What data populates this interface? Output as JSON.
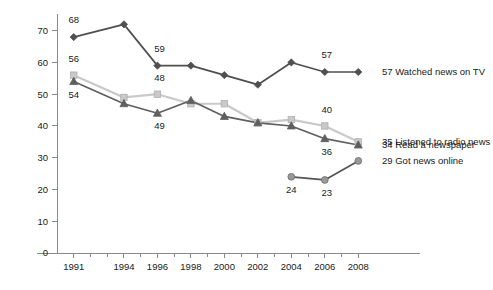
{
  "chart_data": {
    "type": "line",
    "title": "",
    "subtitle": "",
    "xlabel": "",
    "ylabel": "",
    "x": [
      1991,
      1994,
      1996,
      1998,
      2000,
      2002,
      2004,
      2006,
      2008
    ],
    "xtick_labels": [
      "1991",
      "1994",
      "1996",
      "1998",
      "2000",
      "2002",
      "2004",
      "2006",
      "2008"
    ],
    "ytick_labels": [
      "0",
      "10",
      "20",
      "30",
      "40",
      "50",
      "60",
      "70"
    ],
    "ytick_values": [
      0,
      10,
      20,
      30,
      40,
      50,
      60,
      70
    ],
    "xlim": [
      1990,
      2009
    ],
    "ylim": [
      0,
      74
    ],
    "grid": false,
    "legend_position": "right-inline-end-of-line",
    "series": [
      {
        "name": "Watched news on TV",
        "marker": "diamond",
        "color": "#4f4f4f",
        "x": [
          1991,
          1994,
          1996,
          1998,
          2000,
          2002,
          2004,
          2006,
          2008
        ],
        "values": [
          68,
          72,
          59,
          59,
          56,
          53,
          60,
          57,
          57
        ],
        "point_labels": [
          {
            "x": 1991,
            "value": 68,
            "text": "68",
            "dx": 0,
            "dy": -14
          },
          {
            "x": 1996,
            "value": 59,
            "text": "59",
            "dx": 2,
            "dy": -14
          },
          {
            "x": 2006,
            "value": 57,
            "text": "57",
            "dx": 2,
            "dy": -14
          }
        ],
        "end_label": "57 Watched news on TV"
      },
      {
        "name": "Listened to radio news",
        "marker": "square",
        "color": "#c9c9c9",
        "x": [
          1991,
          1994,
          1996,
          1998,
          2000,
          2002,
          2004,
          2006,
          2008
        ],
        "values": [
          56,
          49,
          50,
          47,
          47,
          41,
          42,
          40,
          35
        ],
        "point_labels": [
          {
            "x": 1991,
            "value": 56,
            "text": "56",
            "dx": 0,
            "dy": -13
          },
          {
            "x": 1996,
            "value": 50,
            "text": "48",
            "dx": 2,
            "dy": -13
          },
          {
            "x": 2006,
            "value": 40,
            "text": "40",
            "dx": 2,
            "dy": -13
          }
        ],
        "end_label": "35 Listened to radio news"
      },
      {
        "name": "Read a newspaper",
        "marker": "triangle",
        "color": "#5f5f5f",
        "x": [
          1991,
          1994,
          1996,
          1998,
          2000,
          2002,
          2004,
          2006,
          2008
        ],
        "values": [
          54,
          47,
          44,
          48,
          43,
          41,
          40,
          36,
          34
        ],
        "point_labels": [
          {
            "x": 1991,
            "value": 54,
            "text": "54",
            "dx": 0,
            "dy": 16
          },
          {
            "x": 1996,
            "value": 44,
            "text": "49",
            "dx": 2,
            "dy": 16
          },
          {
            "x": 2006,
            "value": 36,
            "text": "36",
            "dx": 2,
            "dy": 16
          }
        ],
        "end_label": "34 Read a newspaper"
      },
      {
        "name": "Got news online",
        "marker": "circle",
        "color": "#9a9a9a",
        "x": [
          2004,
          2006,
          2008
        ],
        "values": [
          24,
          23,
          29
        ],
        "point_labels": [
          {
            "x": 2004,
            "value": 24,
            "text": "24",
            "dx": 0,
            "dy": 16
          },
          {
            "x": 2006,
            "value": 23,
            "text": "23",
            "dx": 2,
            "dy": 16
          }
        ],
        "end_label": "29 Got news online"
      }
    ],
    "legend_entries": [
      {
        "label": "57 Watched news on TV",
        "color": "#4f4f4f",
        "marker": "diamond",
        "y_value": 57
      },
      {
        "label": "35 Listened to radio news",
        "color": "#c9c9c9",
        "marker": "square",
        "y_value": 35
      },
      {
        "label": "34 Read a newspaper",
        "color": "#5f5f5f",
        "marker": "triangle",
        "y_value": 34
      },
      {
        "label": "29 Got news online",
        "color": "#9a9a9a",
        "marker": "circle",
        "y_value": 29
      }
    ],
    "axis_color": "#8a8a8a",
    "text_color": "#1a1a1a",
    "background_color": "#ffffff"
  }
}
